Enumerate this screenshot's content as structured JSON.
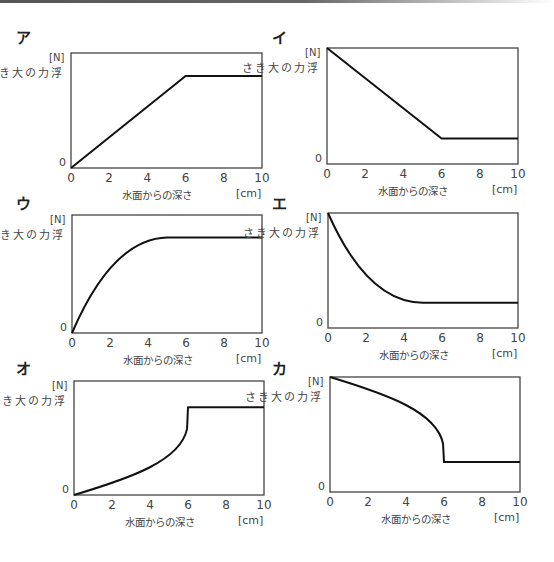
{
  "axes": {
    "y_unit": "[N]",
    "y_label": "浮力の大きさ",
    "y_zero": "0",
    "x_label": "水面からの深さ",
    "x_unit": "[cm]",
    "x_ticks": [
      "0",
      "2",
      "4",
      "6",
      "8",
      "10"
    ]
  },
  "panels": [
    {
      "label": "ア"
    },
    {
      "label": "イ"
    },
    {
      "label": "ウ"
    },
    {
      "label": "エ"
    },
    {
      "label": "オ"
    },
    {
      "label": "カ"
    }
  ],
  "chart_data": [
    {
      "type": "line",
      "title": "ア",
      "xlabel": "水面からの深さ [cm]",
      "ylabel": "浮力の大きさ [N]",
      "xlim": [
        0,
        10
      ],
      "ylim": [
        0,
        1
      ],
      "grid": false,
      "x": [
        0,
        6,
        10
      ],
      "y": [
        0,
        0.8,
        0.8
      ],
      "shape": "linear rise to x=6 then constant"
    },
    {
      "type": "line",
      "title": "イ",
      "xlabel": "水面からの深さ [cm]",
      "ylabel": "浮力の大きさ [N]",
      "xlim": [
        0,
        10
      ],
      "ylim": [
        0,
        1
      ],
      "grid": false,
      "x": [
        0,
        6,
        10
      ],
      "y": [
        1.0,
        0.22,
        0.22
      ],
      "shape": "linear fall to x=6 then constant"
    },
    {
      "type": "line",
      "title": "ウ",
      "xlabel": "水面からの深さ [cm]",
      "ylabel": "浮力の大きさ [N]",
      "xlim": [
        0,
        10
      ],
      "ylim": [
        0,
        1
      ],
      "grid": false,
      "x": [
        0,
        1,
        2,
        3,
        4,
        5,
        6,
        10
      ],
      "y": [
        0,
        0.34,
        0.58,
        0.72,
        0.79,
        0.81,
        0.81,
        0.81
      ],
      "shape": "concave rise flattening near x=5"
    },
    {
      "type": "line",
      "title": "エ",
      "xlabel": "水面からの深さ [cm]",
      "ylabel": "浮力の大きさ [N]",
      "xlim": [
        0,
        10
      ],
      "ylim": [
        0,
        1
      ],
      "grid": false,
      "x": [
        0,
        1,
        2,
        3,
        4,
        5,
        6,
        10
      ],
      "y": [
        1.0,
        0.68,
        0.45,
        0.31,
        0.24,
        0.22,
        0.22,
        0.22
      ],
      "shape": "convex fall flattening near x=5"
    },
    {
      "type": "line",
      "title": "オ",
      "xlabel": "水面からの深さ [cm]",
      "ylabel": "浮力の大きさ [N]",
      "xlim": [
        0,
        10
      ],
      "ylim": [
        0,
        1
      ],
      "grid": false,
      "x": [
        0,
        2,
        4,
        5,
        5.7,
        6,
        10
      ],
      "y": [
        0,
        0.13,
        0.28,
        0.4,
        0.52,
        0.77,
        0.77
      ],
      "shape": "accelerating rise, vertical at x=6, then constant"
    },
    {
      "type": "line",
      "title": "カ",
      "xlabel": "水面からの深さ [cm]",
      "ylabel": "浮力の大きさ [N]",
      "xlim": [
        0,
        10
      ],
      "ylim": [
        0,
        1
      ],
      "grid": false,
      "x": [
        0,
        2,
        4,
        5,
        5.7,
        6,
        6,
        10
      ],
      "y": [
        1.0,
        0.87,
        0.7,
        0.55,
        0.42,
        0.27,
        0.26,
        0.26
      ],
      "shape": "accelerating fall, vertical at x=6, then constant"
    }
  ]
}
